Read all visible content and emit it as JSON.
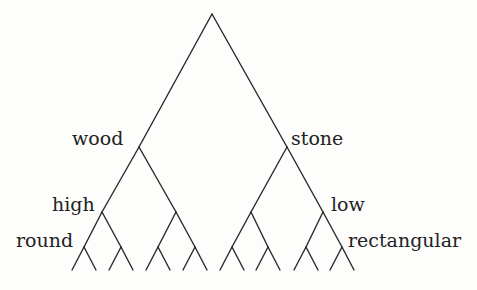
{
  "diagram": {
    "type": "binary-tree",
    "line_color": "#2a2a2a",
    "text_color": "#222222",
    "background": "#fdfdfc",
    "labels": {
      "wood": "wood",
      "stone": "stone",
      "high": "high",
      "low": "low",
      "round": "round",
      "rectangular": "rectangular"
    },
    "levels": [
      {
        "depth": 1,
        "left_label": "wood",
        "right_label": "stone"
      },
      {
        "depth": 2,
        "left_label": "high",
        "right_label": "low"
      },
      {
        "depth": 3,
        "left_label": "round",
        "right_label": "rectangular"
      },
      {
        "depth": 4,
        "left_label": "",
        "right_label": ""
      }
    ],
    "nodes": {
      "root": [
        212,
        14
      ],
      "level1": [
        [
          139,
          147
        ],
        [
          287,
          147
        ]
      ],
      "level2": [
        [
          102,
          212
        ],
        [
          176,
          212
        ],
        [
          251,
          212
        ],
        [
          323,
          212
        ]
      ],
      "level3": [
        [
          84,
          247
        ],
        [
          121,
          247
        ],
        [
          158,
          247
        ],
        [
          195,
          247
        ],
        [
          232,
          247
        ],
        [
          268,
          247
        ],
        [
          306,
          247
        ],
        [
          342,
          247
        ]
      ],
      "leaf_y": 270,
      "leaf_spread": 12
    }
  }
}
